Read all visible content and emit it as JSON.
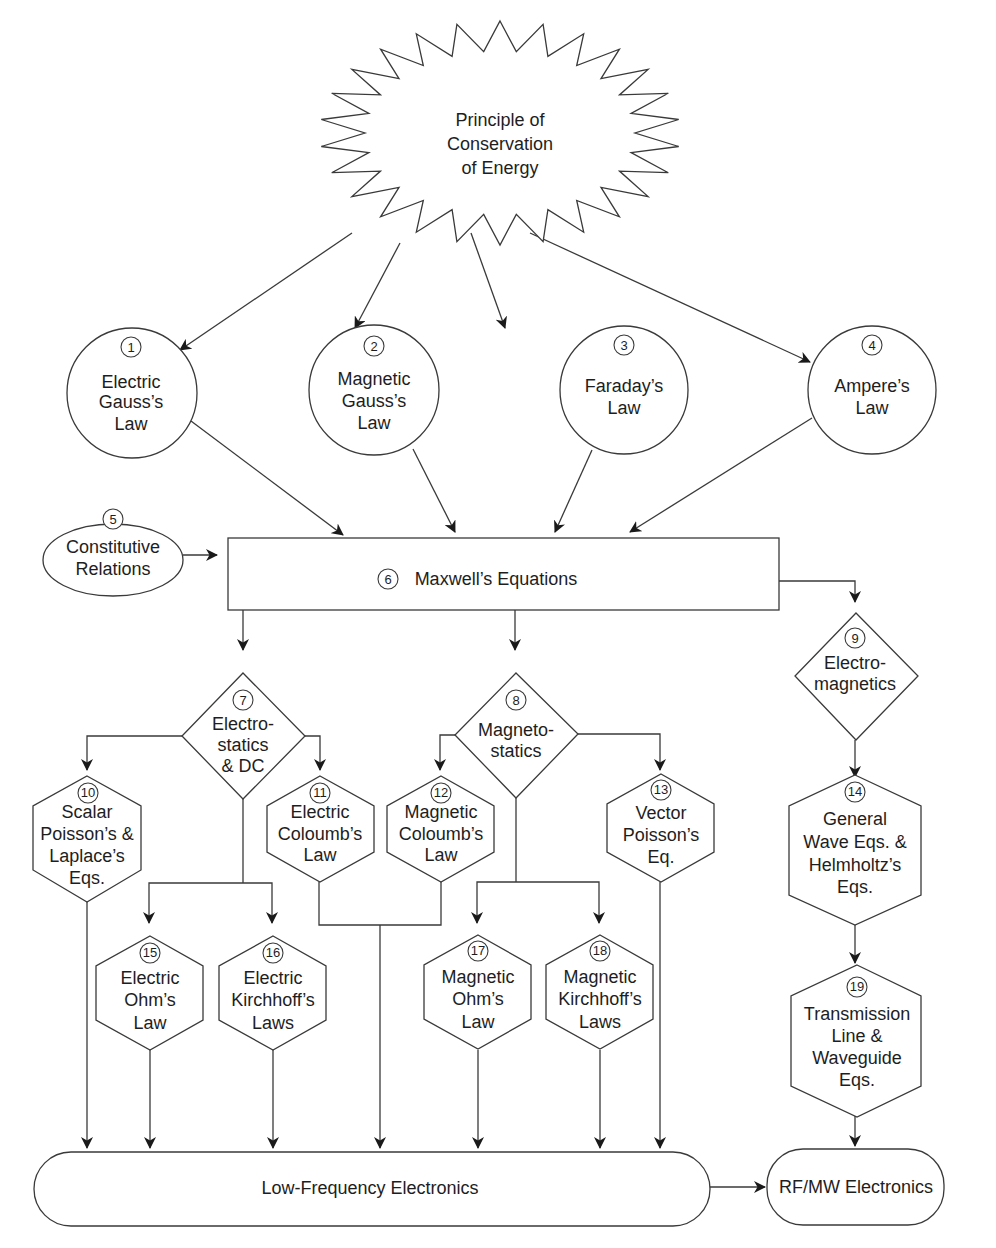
{
  "diagram": {
    "type": "flowchart",
    "nodes": {
      "energy": {
        "shape": "starburst",
        "lines": [
          "Principle of",
          "Conservation",
          "of Energy"
        ]
      },
      "n1": {
        "num": "1",
        "shape": "circle",
        "lines": [
          "Electric",
          "Gauss’s",
          "Law"
        ]
      },
      "n2": {
        "num": "2",
        "shape": "circle",
        "lines": [
          "Magnetic",
          "Gauss’s",
          "Law"
        ]
      },
      "n3": {
        "num": "3",
        "shape": "circle",
        "lines": [
          "Faraday’s",
          "Law"
        ]
      },
      "n4": {
        "num": "4",
        "shape": "circle",
        "lines": [
          "Ampere’s",
          "Law"
        ]
      },
      "n5": {
        "num": "5",
        "shape": "ellipse",
        "lines": [
          "Constitutive",
          "Relations"
        ]
      },
      "n6": {
        "num": "6",
        "shape": "rectangle",
        "lines": [
          "Maxwell’s Equations"
        ]
      },
      "n7": {
        "num": "7",
        "shape": "diamond",
        "lines": [
          "Electro-",
          "statics",
          "& DC"
        ]
      },
      "n8": {
        "num": "8",
        "shape": "diamond",
        "lines": [
          "Magneto-",
          "statics"
        ]
      },
      "n9": {
        "num": "9",
        "shape": "diamond",
        "lines": [
          "Electro-",
          "magnetics"
        ]
      },
      "n10": {
        "num": "10",
        "shape": "hexagon",
        "lines": [
          "Scalar",
          "Poisson’s &",
          "Laplace’s",
          "Eqs."
        ]
      },
      "n11": {
        "num": "11",
        "shape": "hexagon",
        "lines": [
          "Electric",
          "Coloumb’s",
          "Law"
        ]
      },
      "n12": {
        "num": "12",
        "shape": "hexagon",
        "lines": [
          "Magnetic",
          "Coloumb’s",
          "Law"
        ]
      },
      "n13": {
        "num": "13",
        "shape": "hexagon",
        "lines": [
          "Vector",
          "Poisson’s",
          "Eq."
        ]
      },
      "n14": {
        "num": "14",
        "shape": "hexagon",
        "lines": [
          "General",
          "Wave Eqs. &",
          "Helmholtz’s",
          "Eqs."
        ]
      },
      "n15": {
        "num": "15",
        "shape": "hexagon",
        "lines": [
          "Electric",
          "Ohm’s",
          "Law"
        ]
      },
      "n16": {
        "num": "16",
        "shape": "hexagon",
        "lines": [
          "Electric",
          "Kirchhoff’s",
          "Laws"
        ]
      },
      "n17": {
        "num": "17",
        "shape": "hexagon",
        "lines": [
          "Magnetic",
          "Ohm’s",
          "Law"
        ]
      },
      "n18": {
        "num": "18",
        "shape": "hexagon",
        "lines": [
          "Magnetic",
          "Kirchhoff’s",
          "Laws"
        ]
      },
      "n19": {
        "num": "19",
        "shape": "hexagon",
        "lines": [
          "Transmission",
          "Line &",
          "Waveguide",
          "Eqs."
        ]
      },
      "lowfreq": {
        "shape": "rounded-rect",
        "lines": [
          "Low-Frequency Electronics"
        ]
      },
      "rfmw": {
        "shape": "rounded-rect",
        "lines": [
          "RF/MW Electronics"
        ]
      }
    },
    "edges": [
      [
        "energy",
        "n1"
      ],
      [
        "energy",
        "n2"
      ],
      [
        "energy",
        "n3"
      ],
      [
        "energy",
        "n4"
      ],
      [
        "n1",
        "n6"
      ],
      [
        "n2",
        "n6"
      ],
      [
        "n3",
        "n6"
      ],
      [
        "n4",
        "n6"
      ],
      [
        "n5",
        "n6"
      ],
      [
        "n6",
        "n7"
      ],
      [
        "n6",
        "n8"
      ],
      [
        "n6",
        "n9"
      ],
      [
        "n7",
        "n10"
      ],
      [
        "n7",
        "n11"
      ],
      [
        "n7",
        "n15"
      ],
      [
        "n7",
        "n16"
      ],
      [
        "n8",
        "n12"
      ],
      [
        "n8",
        "n13"
      ],
      [
        "n8",
        "n17"
      ],
      [
        "n8",
        "n18"
      ],
      [
        "n9",
        "n14"
      ],
      [
        "n14",
        "n19"
      ],
      [
        "n19",
        "rfmw"
      ],
      [
        "n10",
        "lowfreq"
      ],
      [
        "n11",
        "lowfreq"
      ],
      [
        "n12",
        "lowfreq"
      ],
      [
        "n13",
        "lowfreq"
      ],
      [
        "n15",
        "lowfreq"
      ],
      [
        "n16",
        "lowfreq"
      ],
      [
        "n17",
        "lowfreq"
      ],
      [
        "n18",
        "lowfreq"
      ],
      [
        "lowfreq",
        "rfmw"
      ]
    ]
  }
}
